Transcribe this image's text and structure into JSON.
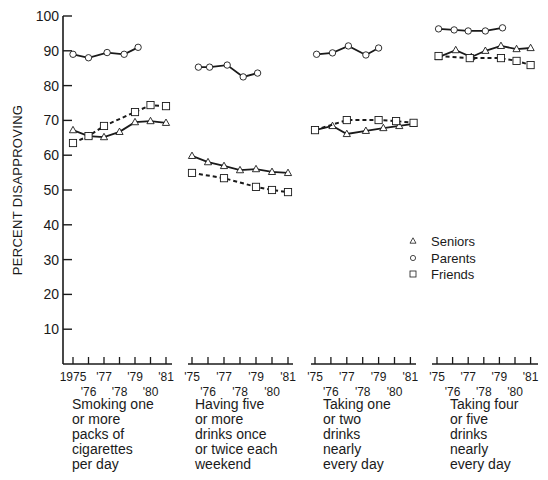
{
  "chart_data": {
    "type": "line",
    "title": "",
    "ylabel": "PERCENT DISAPPROVING",
    "xlabel": "",
    "ylim": [
      0,
      100
    ],
    "yticks": [
      10,
      20,
      30,
      40,
      50,
      60,
      70,
      80,
      90,
      100
    ],
    "grid": false,
    "legend": {
      "position": "right-middle",
      "entries": [
        {
          "name": "Seniors",
          "marker": "triangle"
        },
        {
          "name": "Parents",
          "marker": "circle"
        },
        {
          "name": "Friends",
          "marker": "square"
        }
      ]
    },
    "panels": [
      {
        "caption": "Smoking one\nor more\npacks of\ncigarettes\nper day",
        "x_tick_labels_top": [
          "1975",
          "'77",
          "'79",
          "'81"
        ],
        "x_tick_labels_bottom": [
          "'76",
          "'78",
          "'80"
        ],
        "series": [
          {
            "name": "Parents",
            "style": "solid",
            "marker": "circle",
            "x": [
              1975,
              1976,
              1977.2,
              1978.3,
              1979.2
            ],
            "values": [
              89,
              88,
              89.5,
              89,
              91
            ]
          },
          {
            "name": "Seniors",
            "style": "solid",
            "marker": "triangle",
            "x": [
              1975,
              1976,
              1977,
              1978,
              1979,
              1980,
              1981
            ],
            "values": [
              67.2,
              65.5,
              65.2,
              66.7,
              69.5,
              69.8,
              69.3
            ]
          },
          {
            "name": "Friends",
            "style": "dashed",
            "marker": "square",
            "x": [
              1975,
              1976,
              1977,
              1979,
              1980,
              1981
            ],
            "values": [
              63.5,
              65.5,
              68.4,
              72.4,
              74.4,
              74.1
            ]
          }
        ]
      },
      {
        "caption": "Having five\nor more\ndrinks once\nor twice each\nweekend",
        "x_tick_labels_top": [
          "'75",
          "'77",
          "'79",
          "'81"
        ],
        "x_tick_labels_bottom": [
          "'76",
          "'78",
          "'80"
        ],
        "series": [
          {
            "name": "Parents",
            "style": "solid",
            "marker": "circle",
            "x": [
              1975.4,
              1976.1,
              1977.2,
              1978.2,
              1979.1
            ],
            "values": [
              85.3,
              85.3,
              85.9,
              82.5,
              83.6
            ]
          },
          {
            "name": "Seniors",
            "style": "solid",
            "marker": "triangle",
            "x": [
              1975,
              1976,
              1977,
              1978,
              1979,
              1980,
              1981
            ],
            "values": [
              59.8,
              58,
              56.9,
              55.7,
              56,
              55.2,
              54.9
            ]
          },
          {
            "name": "Friends",
            "style": "dashed",
            "marker": "square",
            "x": [
              1975,
              1977,
              1979,
              1980,
              1981
            ],
            "values": [
              54.9,
              53.4,
              50.9,
              50,
              49.4
            ]
          }
        ]
      },
      {
        "caption": "Taking one\nor two\ndrinks\nnearly\nevery day",
        "x_tick_labels_top": [
          "'75",
          "'77",
          "'79",
          "'81"
        ],
        "x_tick_labels_bottom": [
          "'76",
          "'78",
          "'80"
        ],
        "series": [
          {
            "name": "Parents",
            "style": "solid",
            "marker": "circle",
            "x": [
              1975.1,
              1976.1,
              1977.1,
              1978.2,
              1979.0
            ],
            "values": [
              89,
              89.4,
              91.4,
              88.8,
              90.8
            ]
          },
          {
            "name": "Seniors",
            "style": "solid",
            "marker": "triangle",
            "x": [
              1975,
              1976.1,
              1977,
              1978.2,
              1979.3,
              1980.3,
              1981.2
            ],
            "values": [
              67.2,
              68.4,
              66.1,
              67,
              67.8,
              68.4,
              69
            ]
          },
          {
            "name": "Friends",
            "style": "dashed",
            "marker": "square",
            "x": [
              1975,
              1977,
              1979,
              1980.1,
              1981.2
            ],
            "values": [
              67.2,
              70.1,
              70.1,
              69.8,
              69.3
            ]
          }
        ]
      },
      {
        "caption": "Taking four\nor five\ndrinks\nnearly\nevery day",
        "x_tick_labels_top": [
          "'75",
          "'77",
          "'79",
          "'81"
        ],
        "x_tick_labels_bottom": [
          "'76",
          "'78",
          "'80"
        ],
        "series": [
          {
            "name": "Parents",
            "style": "solid",
            "marker": "circle",
            "x": [
              1975.1,
              1976.1,
              1977,
              1978.1,
              1979.2
            ],
            "values": [
              96.3,
              96,
              95.7,
              95.7,
              96.6
            ]
          },
          {
            "name": "Seniors",
            "style": "solid",
            "marker": "triangle",
            "x": [
              1975.1,
              1976.2,
              1977.2,
              1978.1,
              1979.1,
              1980.1,
              1981
            ],
            "values": [
              88.2,
              90.2,
              88.2,
              90,
              91.4,
              90.5,
              90.8
            ]
          },
          {
            "name": "Friends",
            "style": "dashed",
            "marker": "square",
            "x": [
              1975.1,
              1977.1,
              1979.1,
              1980.1,
              1981
            ],
            "values": [
              88.5,
              87.9,
              87.9,
              87.1,
              85.9
            ]
          }
        ]
      }
    ]
  },
  "layout": {
    "y0_px": 364,
    "px_per_unit": 3.48,
    "yaxis_x": 63,
    "panel_axes": [
      {
        "x_start": 63,
        "x_end": 172,
        "year0_px": 73,
        "px_per_year": 15.5
      },
      {
        "x_start": 188,
        "x_end": 293,
        "year0_px": 192,
        "px_per_year": 16
      },
      {
        "x_start": 311,
        "x_end": 416,
        "year0_px": 315,
        "px_per_year": 15.9
      },
      {
        "x_start": 432,
        "x_end": 538,
        "year0_px": 437,
        "px_per_year": 15.6
      }
    ],
    "caption_x": [
      72,
      195,
      323,
      450
    ],
    "legend_x": 413,
    "legend_y": [
      241,
      258,
      274
    ],
    "ink": "#1a1a1a"
  }
}
